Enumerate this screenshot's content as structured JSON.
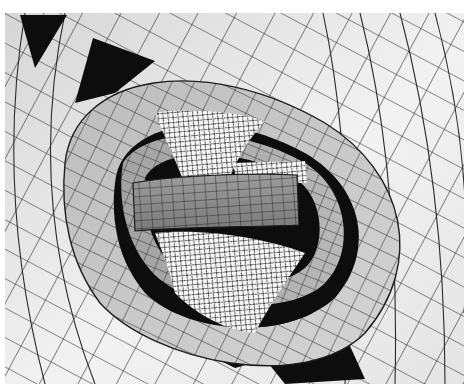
{
  "image": {
    "subject": "nested-mathematical-surfaces-wireframe-render",
    "palette": {
      "background": "#ffffff",
      "outer_surface": "#e9e9e9",
      "mid_surface": "#c4c4c4",
      "inner_band": "#9a9a9a",
      "core_tube": "#8c8c8c",
      "void": "#0d0d0d",
      "hyperboloid": "#f6f6f6",
      "mesh_line": "#2a2a2a"
    },
    "frame": {
      "left": 5,
      "top": 13,
      "right": 464,
      "bottom": 384
    }
  }
}
